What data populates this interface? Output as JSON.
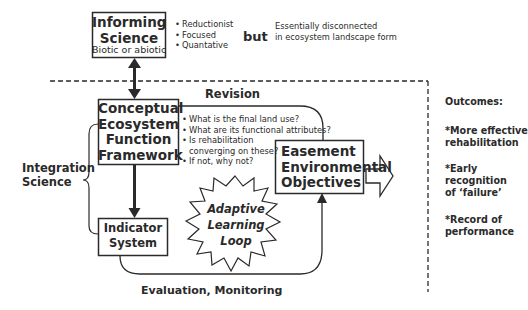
{
  "informing_science": {
    "title_line1": "Informing",
    "title_line2": "Science",
    "subtitle": "Biotic or abiotic",
    "bullets": [
      "Reductionist",
      "Focused",
      "Quantative"
    ],
    "connector_word": "but",
    "note_line1": "Essentially disconnected",
    "note_line2": "in ecosystem landscape form"
  },
  "framework_box": {
    "lines": [
      "Conceptual",
      "Ecosystem",
      "Function",
      "Framework"
    ]
  },
  "revision": {
    "label": "Revision",
    "questions": [
      "What is the final land use?",
      "What are its functional attributes?",
      "Is rehabilitation",
      "converging on these?",
      "If not, why not?"
    ]
  },
  "easement_box": {
    "lines": [
      "Easement",
      "Environmental",
      "Objectives"
    ]
  },
  "integration_science": {
    "line1": "Integration",
    "line2": "Science"
  },
  "indicator_box": {
    "lines": [
      "Indicator",
      "System"
    ]
  },
  "adaptive_loop": {
    "lines": [
      "Adaptive",
      "Learning",
      "Loop"
    ]
  },
  "evaluation": {
    "label": "Evaluation, Monitoring"
  },
  "outcomes": {
    "title": "Outcomes:",
    "items": [
      {
        "line1": "*More effective",
        "line2": "rehabilitation"
      },
      {
        "line1": "*Early",
        "line2": "recognition",
        "line3": "of ‘failure’"
      },
      {
        "line1": "*Record of",
        "line2": "performance"
      }
    ]
  },
  "colors": {
    "stroke": "#2a2a2a",
    "background": "#ffffff"
  }
}
